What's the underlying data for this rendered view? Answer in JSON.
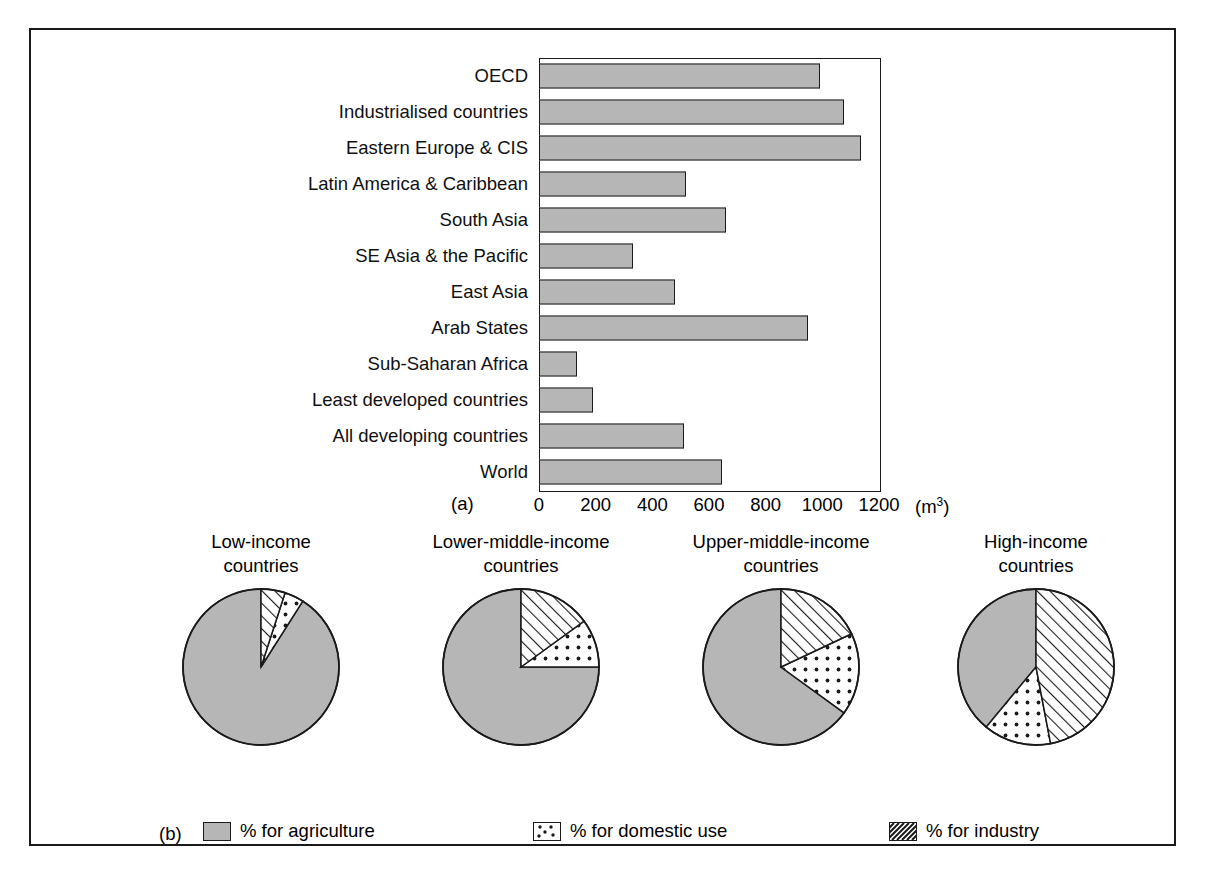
{
  "figure": {
    "panel_a_tag": "(a)",
    "panel_b_tag": "(b)",
    "unit_label": "(m",
    "unit_exponent": "3",
    "unit_close": ")"
  },
  "chart_data": [
    {
      "type": "bar",
      "orientation": "horizontal",
      "title": "",
      "xlabel": "(m3)",
      "ylabel": "",
      "xlim": [
        0,
        1200
      ],
      "xticks": [
        0,
        200,
        400,
        600,
        800,
        1000,
        1200
      ],
      "xtick_labels": [
        "0",
        "200",
        "400",
        "600",
        "800",
        "1000",
        "1200"
      ],
      "grid": false,
      "bar_color": "#b6b6b6",
      "bar_edge_color": "#1a1a1a",
      "categories": [
        "OECD",
        "Industrialised countries",
        "Eastern Europe & CIS",
        "Latin America & Caribbean",
        "South Asia",
        "SE Asia & the Pacific",
        "East Asia",
        "Arab States",
        "Sub-Saharan Africa",
        "Least developed countries",
        "All developing countries",
        "World"
      ],
      "values": [
        990,
        1075,
        1135,
        520,
        660,
        330,
        480,
        950,
        135,
        190,
        510,
        645
      ]
    },
    {
      "type": "pie",
      "title": "Low-income\ncountries",
      "title_lines": [
        "Low-income",
        "countries"
      ],
      "labels": [
        "% for agriculture",
        "% for domestic use",
        "% for industry"
      ],
      "values": [
        91,
        4,
        5
      ],
      "start_angle_deg": 0,
      "direction": "counterclockwise"
    },
    {
      "type": "pie",
      "title": "Lower-middle-income\ncountries",
      "title_lines": [
        "Lower-middle-income",
        "countries"
      ],
      "labels": [
        "% for agriculture",
        "% for domestic use",
        "% for industry"
      ],
      "values": [
        75,
        10,
        15
      ],
      "start_angle_deg": 0,
      "direction": "counterclockwise"
    },
    {
      "type": "pie",
      "title": "Upper-middle-income\ncountries",
      "title_lines": [
        "Upper-middle-income",
        "countries"
      ],
      "labels": [
        "% for agriculture",
        "% for domestic use",
        "% for industry"
      ],
      "values": [
        65,
        17,
        18
      ],
      "start_angle_deg": 0,
      "direction": "counterclockwise"
    },
    {
      "type": "pie",
      "title": "High-income\ncountries",
      "title_lines": [
        "High-income",
        "countries"
      ],
      "labels": [
        "% for agriculture",
        "% for domestic use",
        "% for industry"
      ],
      "values": [
        39,
        14,
        47
      ],
      "start_angle_deg": 0,
      "direction": "counterclockwise"
    }
  ],
  "bar_chart": {
    "rows": [
      {
        "label": "OECD",
        "value": 990
      },
      {
        "label": "Industrialised countries",
        "value": 1075
      },
      {
        "label": "Eastern Europe & CIS",
        "value": 1135
      },
      {
        "label": "Latin America & Caribbean",
        "value": 520
      },
      {
        "label": "South Asia",
        "value": 660
      },
      {
        "label": "SE Asia & the Pacific",
        "value": 330
      },
      {
        "label": "East Asia",
        "value": 480
      },
      {
        "label": "Arab States",
        "value": 950
      },
      {
        "label": "Sub-Saharan Africa",
        "value": 135
      },
      {
        "label": "Least developed countries",
        "value": 190
      },
      {
        "label": "All developing countries",
        "value": 510
      },
      {
        "label": "World",
        "value": 645
      }
    ],
    "xticks": [
      "0",
      "200",
      "400",
      "600",
      "800",
      "1000",
      "1200"
    ],
    "xmax": 1200
  },
  "pies": [
    {
      "title_line1": "Low-income",
      "title_line2": "countries",
      "agriculture": 91,
      "domestic": 4,
      "industry": 5
    },
    {
      "title_line1": "Lower-middle-income",
      "title_line2": "countries",
      "agriculture": 75,
      "domestic": 10,
      "industry": 15
    },
    {
      "title_line1": "Upper-middle-income",
      "title_line2": "countries",
      "agriculture": 65,
      "domestic": 17,
      "industry": 18
    },
    {
      "title_line1": "High-income",
      "title_line2": "countries",
      "agriculture": 39,
      "domestic": 14,
      "industry": 47
    }
  ],
  "legend": {
    "items": [
      {
        "key": "agriculture",
        "label": "% for agriculture",
        "pattern": "solid-gray"
      },
      {
        "key": "domestic",
        "label": "% for domestic use",
        "pattern": "dotted"
      },
      {
        "key": "industry",
        "label": "% for industry",
        "pattern": "hatched"
      }
    ]
  },
  "colors": {
    "gray_fill": "#b6b6b6",
    "outline": "#1a1a1a",
    "background": "#ffffff"
  }
}
